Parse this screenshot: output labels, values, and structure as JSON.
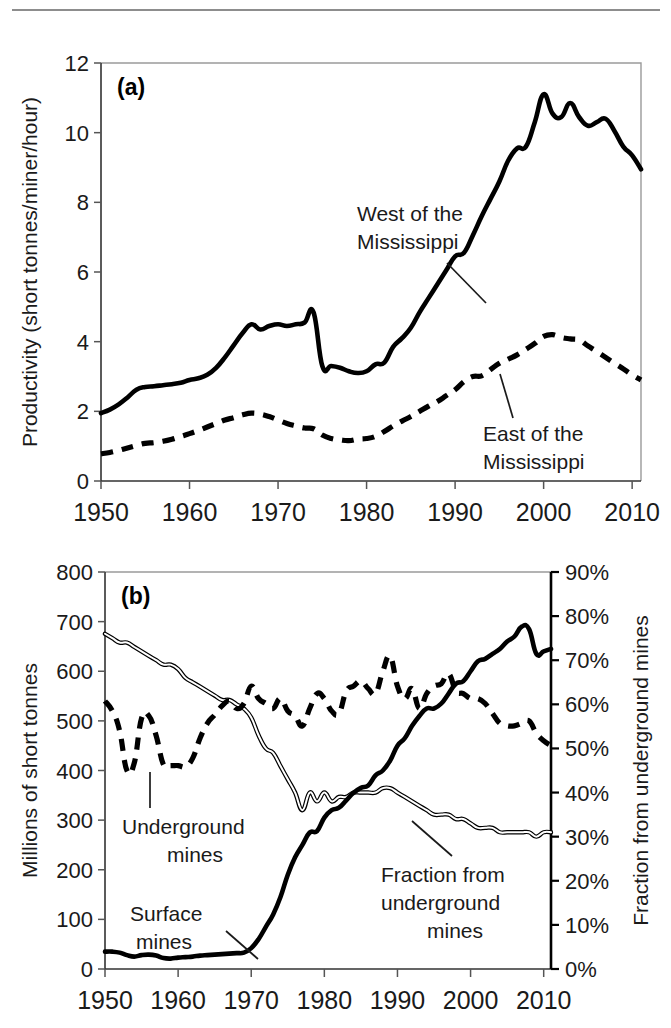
{
  "figure": {
    "top_rule": true
  },
  "chart_data": [
    {
      "type": "line",
      "panel": "(a)",
      "title": "",
      "xlabel": "",
      "ylabel": "Productivity (short tonnes/miner/hour)",
      "xlim": [
        1950,
        2011
      ],
      "ylim": [
        0,
        12
      ],
      "xticks": [
        1950,
        1960,
        1970,
        1980,
        1990,
        2000,
        2010
      ],
      "xtick_labels": [
        "1950",
        "1960",
        "1970",
        "1980",
        "1990",
        "2000",
        "2010"
      ],
      "yticks": [
        0,
        2,
        4,
        6,
        8,
        10,
        12
      ],
      "ytick_labels": [
        "0",
        "2",
        "4",
        "6",
        "8",
        "10",
        "12"
      ],
      "grid": false,
      "legend_position": "inline-annotations",
      "annotations": [
        {
          "text_line1": "West of the",
          "text_line2": "Mississippi",
          "series": "west"
        },
        {
          "text_line1": "East of the",
          "text_line2": "Mississippi",
          "series": "east"
        }
      ],
      "x": [
        1950,
        1951,
        1952,
        1953,
        1954,
        1955,
        1956,
        1957,
        1958,
        1959,
        1960,
        1961,
        1962,
        1963,
        1964,
        1965,
        1966,
        1967,
        1968,
        1969,
        1970,
        1971,
        1972,
        1973,
        1974,
        1975,
        1976,
        1977,
        1978,
        1979,
        1980,
        1981,
        1982,
        1983,
        1984,
        1985,
        1986,
        1987,
        1988,
        1989,
        1990,
        1991,
        1992,
        1993,
        1994,
        1995,
        1996,
        1997,
        1998,
        1999,
        2000,
        2001,
        2002,
        2003,
        2004,
        2005,
        2006,
        2007,
        2008,
        2009,
        2010,
        2011
      ],
      "series": [
        {
          "name": "West of the Mississippi",
          "style": "solid",
          "values": [
            1.95,
            2.05,
            2.2,
            2.4,
            2.62,
            2.7,
            2.72,
            2.75,
            2.78,
            2.82,
            2.9,
            2.95,
            3.05,
            3.25,
            3.55,
            3.9,
            4.25,
            4.5,
            4.35,
            4.45,
            4.5,
            4.45,
            4.5,
            4.55,
            4.85,
            3.3,
            3.3,
            3.25,
            3.15,
            3.1,
            3.15,
            3.35,
            3.4,
            3.85,
            4.1,
            4.4,
            4.85,
            5.25,
            5.65,
            6.05,
            6.45,
            6.55,
            7.05,
            7.6,
            8.1,
            8.6,
            9.2,
            9.55,
            9.6,
            10.3,
            11.1,
            10.55,
            10.45,
            10.85,
            10.45,
            10.2,
            10.3,
            10.4,
            10.05,
            9.6,
            9.35,
            8.95
          ]
        },
        {
          "name": "East of the Mississippi",
          "style": "dashed",
          "values": [
            0.78,
            0.82,
            0.88,
            0.95,
            1.02,
            1.08,
            1.1,
            1.14,
            1.2,
            1.28,
            1.36,
            1.45,
            1.55,
            1.65,
            1.75,
            1.82,
            1.9,
            1.95,
            1.92,
            1.85,
            1.75,
            1.65,
            1.58,
            1.52,
            1.5,
            1.32,
            1.22,
            1.18,
            1.16,
            1.2,
            1.22,
            1.28,
            1.42,
            1.58,
            1.72,
            1.85,
            2.0,
            2.15,
            2.28,
            2.45,
            2.62,
            2.85,
            3.0,
            3.02,
            3.2,
            3.38,
            3.5,
            3.62,
            3.78,
            3.95,
            4.15,
            4.2,
            4.12,
            4.08,
            4.05,
            3.88,
            3.72,
            3.55,
            3.38,
            3.22,
            3.05,
            2.9
          ]
        }
      ]
    },
    {
      "type": "line",
      "panel": "(b)",
      "title": "",
      "xlabel": "",
      "ylabel": "Millions of short tonnes",
      "ylabel_right": "Fraction from underground mines",
      "xlim": [
        1950,
        2011
      ],
      "ylim": [
        0,
        800
      ],
      "ylim_right": [
        0,
        90
      ],
      "xticks": [
        1950,
        1960,
        1970,
        1980,
        1990,
        2000,
        2010
      ],
      "xtick_labels": [
        "1950",
        "1960",
        "1970",
        "1980",
        "1990",
        "2000",
        "2010"
      ],
      "yticks": [
        0,
        100,
        200,
        300,
        400,
        500,
        600,
        700,
        800
      ],
      "ytick_labels": [
        "0",
        "100",
        "200",
        "300",
        "400",
        "500",
        "600",
        "700",
        "800"
      ],
      "yticks_right": [
        0,
        10,
        20,
        30,
        40,
        50,
        60,
        70,
        80,
        90
      ],
      "ytick_labels_right": [
        "0%",
        "10%",
        "20%",
        "30%",
        "40%",
        "50%",
        "60%",
        "70%",
        "80%",
        "90%"
      ],
      "grid": false,
      "legend_position": "inline-annotations",
      "annotations": [
        {
          "text_line1": "Underground",
          "text_line2": "mines",
          "series": "underground"
        },
        {
          "text_line1": "Surface",
          "text_line2": "mines",
          "series": "surface"
        },
        {
          "text_line1": "Fraction from",
          "text_line2": "underground",
          "text_line3": "mines",
          "series": "fraction"
        }
      ],
      "x": [
        1950,
        1951,
        1952,
        1953,
        1954,
        1955,
        1956,
        1957,
        1958,
        1959,
        1960,
        1961,
        1962,
        1963,
        1964,
        1965,
        1966,
        1967,
        1968,
        1969,
        1970,
        1971,
        1972,
        1973,
        1974,
        1975,
        1976,
        1977,
        1978,
        1979,
        1980,
        1981,
        1982,
        1983,
        1984,
        1985,
        1986,
        1987,
        1988,
        1989,
        1990,
        1991,
        1992,
        1993,
        1994,
        1995,
        1996,
        1997,
        1998,
        1999,
        2000,
        2001,
        2002,
        2003,
        2004,
        2005,
        2006,
        2007,
        2008,
        2009,
        2010,
        2011
      ],
      "series": [
        {
          "name": "Underground mines",
          "style": "dashed",
          "axis": "left",
          "units": "Millions of short tonnes",
          "values": [
            540,
            520,
            480,
            400,
            415,
            505,
            510,
            470,
            412,
            410,
            410,
            408,
            425,
            465,
            495,
            512,
            530,
            540,
            525,
            535,
            570,
            545,
            535,
            525,
            545,
            520,
            510,
            490,
            525,
            555,
            545,
            520,
            515,
            560,
            570,
            580,
            565,
            555,
            600,
            630,
            570,
            545,
            565,
            525,
            555,
            570,
            575,
            595,
            560,
            555,
            545,
            545,
            535,
            515,
            495,
            490,
            490,
            495,
            500,
            475,
            460,
            450
          ]
        },
        {
          "name": "Surface mines",
          "style": "solid",
          "axis": "left",
          "units": "Millions of short tonnes",
          "values": [
            35,
            35,
            33,
            28,
            25,
            28,
            29,
            27,
            22,
            21,
            23,
            24,
            25,
            27,
            28,
            29,
            30,
            31,
            32,
            33,
            42,
            60,
            85,
            110,
            145,
            190,
            225,
            250,
            275,
            278,
            305,
            320,
            325,
            340,
            355,
            365,
            370,
            390,
            400,
            420,
            450,
            465,
            490,
            510,
            525,
            525,
            535,
            555,
            575,
            580,
            600,
            620,
            625,
            635,
            645,
            660,
            670,
            690,
            685,
            635,
            640,
            645
          ]
        },
        {
          "name": "Fraction from underground mines",
          "style": "outline",
          "axis": "right",
          "units": "percent",
          "values": [
            76,
            75,
            74,
            74,
            73,
            72,
            71,
            70,
            69,
            69,
            68,
            66,
            65,
            64,
            63,
            62,
            61,
            61,
            60,
            59,
            57,
            53,
            50,
            49,
            46,
            43,
            40,
            36,
            40,
            38,
            40,
            38,
            39,
            39,
            40,
            40,
            40,
            40,
            41,
            41,
            40,
            39,
            38,
            37,
            36,
            35,
            35,
            35,
            34,
            34,
            33,
            32,
            32,
            32,
            31,
            31,
            31,
            31,
            31,
            30,
            31,
            31
          ]
        }
      ]
    }
  ]
}
